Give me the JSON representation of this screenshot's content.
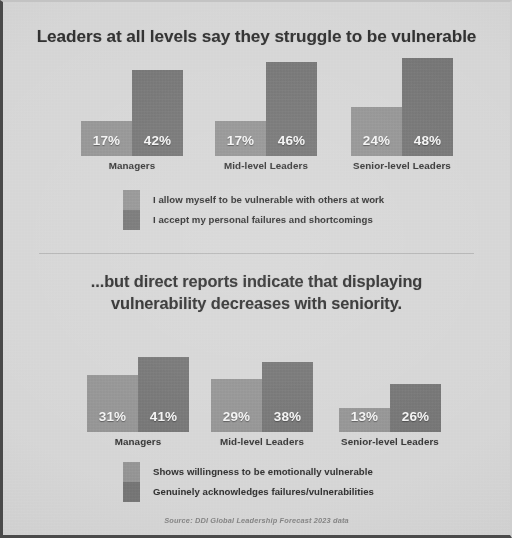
{
  "source_note": "Source: DDI Global Leadership Forecast 2023 data",
  "colors": {
    "background": "#d3d3d3",
    "series_light": "#8d8d8d",
    "series_dark": "#6e6e6e",
    "text": "#2e2e2e",
    "value_text": "#f4f4f4",
    "source_text": "#7b7b7b"
  },
  "charts": [
    {
      "id": "leaders-self-report",
      "title": "Leaders at all levels say they struggle to be vulnerable",
      "chart_data": {
        "type": "bar",
        "title": "Leaders at all levels say they struggle to be vulnerable",
        "xlabel": "",
        "ylabel": "",
        "ylim": [
          0,
          50
        ],
        "grid": false,
        "legend_position": "bottom-left",
        "value_suffix": "%",
        "categories": [
          "Managers",
          "Mid-level Leaders",
          "Senior-level Leaders"
        ],
        "series": [
          {
            "name": "I allow myself to be vulnerable with others at work",
            "color": "#8d8d8d",
            "values": [
              17,
              17,
              24
            ],
            "labels": [
              "17%",
              "17%",
              "24%"
            ]
          },
          {
            "name": "I accept my personal failures and shortcomings",
            "color": "#6e6e6e",
            "values": [
              42,
              46,
              48
            ],
            "labels": [
              "42%",
              "46%",
              "48%"
            ]
          }
        ]
      }
    },
    {
      "id": "direct-reports-view",
      "title_line1": "...but direct reports indicate that displaying",
      "title_line2": "vulnerability decreases with seniority.",
      "chart_data": {
        "type": "bar",
        "title": "...but direct reports indicate that displaying vulnerability decreases with seniority.",
        "xlabel": "",
        "ylabel": "",
        "ylim": [
          0,
          50
        ],
        "grid": false,
        "legend_position": "bottom-left",
        "value_suffix": "%",
        "categories": [
          "Managers",
          "Mid-level Leaders",
          "Senior-level Leaders"
        ],
        "series": [
          {
            "name": "Shows willingness to be emotionally vulnerable",
            "color": "#8d8d8d",
            "values": [
              31,
              29,
              13
            ],
            "labels": [
              "31%",
              "29%",
              "13%"
            ]
          },
          {
            "name": "Genuinely acknowledges failures/vulnerabilities",
            "color": "#6e6e6e",
            "values": [
              41,
              38,
              26
            ],
            "labels": [
              "41%",
              "38%",
              "26%"
            ]
          }
        ]
      }
    }
  ]
}
